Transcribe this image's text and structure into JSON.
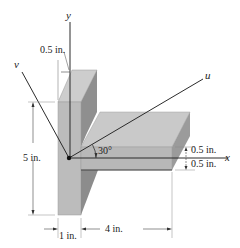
{
  "figure": {
    "type": "T-section cross-section isometric",
    "axes": {
      "y": "y",
      "x": "x",
      "u": "u",
      "v": "v"
    },
    "angle_label": "30°",
    "dimensions": {
      "web_thickness_top": "0.5 in.",
      "height": "5 in.",
      "web_width": "1 in.",
      "flange_length": "4 in.",
      "flange_upper": "0.5 in.",
      "flange_lower": "0.5 in."
    },
    "colors": {
      "front_face": "#b9b9b9",
      "top_face": "#cfcfcf",
      "side_face": "#8e8e8e",
      "line": "#2b2b2b",
      "dim_line": "#555555"
    }
  }
}
